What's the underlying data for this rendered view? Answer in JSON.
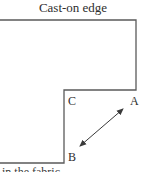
{
  "diagram": {
    "title": "Cast-on edge",
    "labels": {
      "a": "A",
      "b": "B",
      "c": "C"
    },
    "bottom_caption_partial": "in the fabric",
    "colors": {
      "line": "#5a5a5a",
      "arrow": "#3a3a3a",
      "text": "#2e2e2e"
    }
  }
}
